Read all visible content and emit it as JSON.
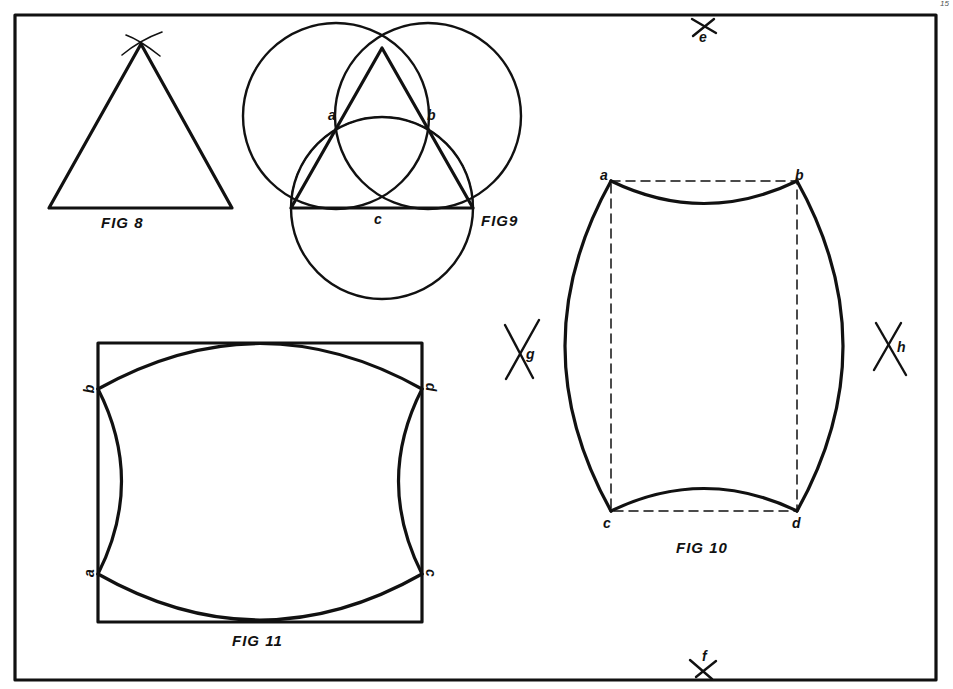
{
  "page": {
    "corner_mark": "15",
    "background": "#ffffff",
    "ink_color": "#111111"
  },
  "figures": {
    "fig8": {
      "caption": "FIG 8",
      "description": "Equilateral triangle with intersecting construction arcs at apex"
    },
    "fig9": {
      "caption": "FIG9",
      "description": "Equilateral triangle inscribed with three circles and dashed arc",
      "points": {
        "a": "a",
        "b": "b",
        "c": "c"
      }
    },
    "fig10": {
      "caption": "FIG 10",
      "description": "Dashed rectangle with concave top/bottom arcs and convex side arcs",
      "points": {
        "a": "a",
        "b": "b",
        "c": "c",
        "d": "d"
      }
    },
    "fig11": {
      "caption": "FIG 11",
      "description": "Rectangle with convex top/bottom arcs and concave side arcs",
      "points": {
        "a": "a",
        "b": "b",
        "c": "c",
        "d": "d"
      }
    }
  },
  "construction_marks": {
    "e": "e",
    "f": "f",
    "g": "g",
    "h": "h"
  }
}
